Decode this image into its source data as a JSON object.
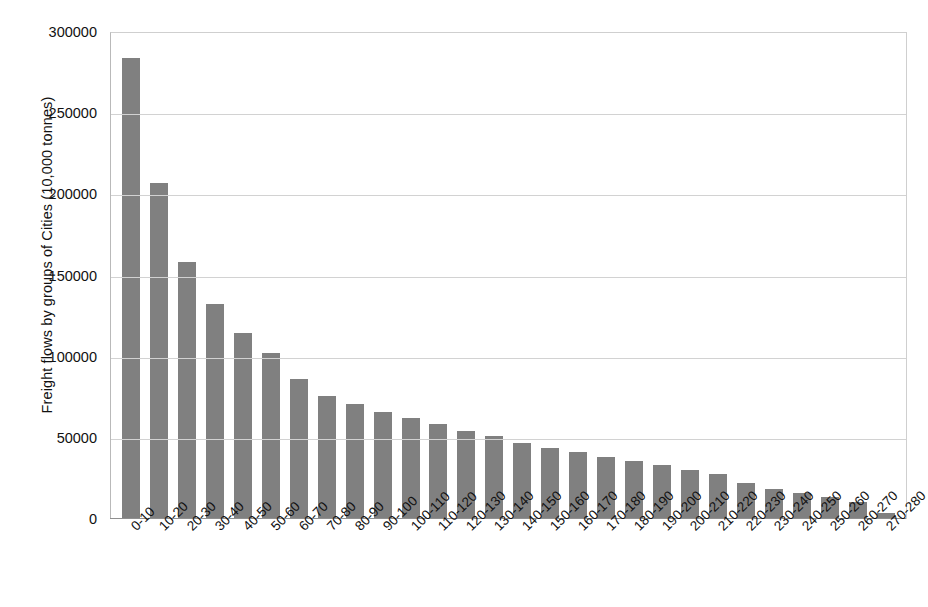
{
  "chart_data": {
    "type": "bar",
    "title": "",
    "subtitle": "",
    "xlabel": "",
    "ylabel": "Freight flows by groups of Cities (10,000 tonnes)",
    "ylim": [
      0,
      300000
    ],
    "ytick_labels": [
      "0",
      "50000",
      "100000",
      "150000",
      "200000",
      "250000",
      "300000"
    ],
    "ytick_values": [
      0,
      50000,
      100000,
      150000,
      200000,
      250000,
      300000
    ],
    "grid": "horizontal",
    "legend": "none",
    "annotations": [],
    "bar_color": "#808080",
    "categories": [
      "0-10",
      "10-20",
      "20-30",
      "30-40",
      "40-50",
      "50-60",
      "60-70",
      "70-80",
      "80-90",
      "90-100",
      "100-110",
      "110-120",
      "120-130",
      "130-140",
      "140-150",
      "150-160",
      "160-170",
      "170-180",
      "180-190",
      "190-200",
      "200-210",
      "210-220",
      "220-230",
      "230-240",
      "240-250",
      "250-260",
      "260-270",
      "270-280"
    ],
    "values": [
      284000,
      207000,
      158500,
      132500,
      114500,
      102000,
      86000,
      76000,
      71000,
      66000,
      62500,
      58500,
      54500,
      51000,
      47000,
      43500,
      41000,
      38500,
      35500,
      33000,
      30500,
      27500,
      22000,
      18500,
      16000,
      13500,
      10500,
      3500
    ]
  }
}
